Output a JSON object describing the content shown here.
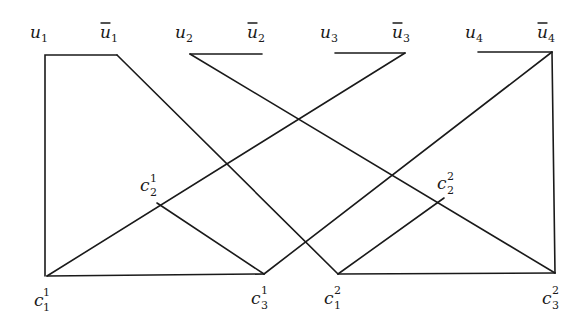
{
  "diagram": {
    "top_labels": [
      {
        "id": "u1",
        "base": "u",
        "sub": "1",
        "bar": false
      },
      {
        "id": "ubar1",
        "base": "u",
        "sub": "1",
        "bar": true
      },
      {
        "id": "u2",
        "base": "u",
        "sub": "2",
        "bar": false
      },
      {
        "id": "ubar2",
        "base": "u",
        "sub": "2",
        "bar": true
      },
      {
        "id": "u3",
        "base": "u",
        "sub": "3",
        "bar": false
      },
      {
        "id": "ubar3",
        "base": "u",
        "sub": "3",
        "bar": true
      },
      {
        "id": "u4",
        "base": "u",
        "sub": "4",
        "bar": false
      },
      {
        "id": "ubar4",
        "base": "u",
        "sub": "4",
        "bar": true
      }
    ],
    "clause_labels": [
      {
        "id": "c1_1",
        "base": "c",
        "sub": "1",
        "sup": "1"
      },
      {
        "id": "c2_1",
        "base": "c",
        "sub": "2",
        "sup": "1"
      },
      {
        "id": "c3_1",
        "base": "c",
        "sub": "3",
        "sup": "1"
      },
      {
        "id": "c1_2",
        "base": "c",
        "sub": "1",
        "sup": "2"
      },
      {
        "id": "c2_2",
        "base": "c",
        "sub": "2",
        "sup": "2"
      },
      {
        "id": "c3_2",
        "base": "c",
        "sub": "3",
        "sup": "2"
      }
    ],
    "line_color": "#1a1a1a"
  }
}
